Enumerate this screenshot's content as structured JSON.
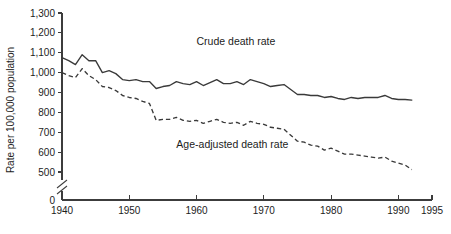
{
  "chart_data": {
    "type": "line",
    "title": "",
    "xlabel": "",
    "ylabel": "Rate per 100,000 population",
    "xlim": [
      1940,
      1995
    ],
    "ylim": [
      500,
      1300
    ],
    "y_axis_break": true,
    "y_axis_break_note": "axis broken between 0 and 500",
    "grid": false,
    "legend_position": "inline-annotation",
    "x_ticks": [
      1940,
      1950,
      1960,
      1970,
      1980,
      1990,
      1995
    ],
    "x_tick_labels": [
      "1940",
      "1950",
      "1960",
      "1970",
      "1980",
      "1990",
      "1995"
    ],
    "y_ticks": [
      500,
      600,
      700,
      800,
      900,
      1000,
      1100,
      1200,
      1300
    ],
    "y_tick_labels": [
      "500",
      "600",
      "700",
      "800",
      "900",
      "1,000",
      "1,100",
      "1,200",
      "1,300"
    ],
    "y_zero_tick_label": "0",
    "x": [
      1940,
      1941,
      1942,
      1943,
      1944,
      1945,
      1946,
      1947,
      1948,
      1949,
      1950,
      1951,
      1952,
      1953,
      1954,
      1955,
      1956,
      1957,
      1958,
      1959,
      1960,
      1961,
      1962,
      1963,
      1964,
      1965,
      1966,
      1967,
      1968,
      1969,
      1970,
      1971,
      1972,
      1973,
      1974,
      1975,
      1976,
      1977,
      1978,
      1979,
      1980,
      1981,
      1982,
      1983,
      1984,
      1985,
      1986,
      1987,
      1988,
      1989,
      1990,
      1991,
      1992
    ],
    "series": [
      {
        "name": "Crude death rate",
        "style": "solid",
        "values": [
          1076,
          1060,
          1040,
          1090,
          1060,
          1060,
          1000,
          1010,
          995,
          965,
          960,
          965,
          955,
          955,
          920,
          930,
          935,
          955,
          945,
          940,
          955,
          935,
          950,
          965,
          945,
          945,
          955,
          940,
          965,
          955,
          945,
          930,
          935,
          940,
          915,
          890,
          890,
          885,
          885,
          875,
          880,
          870,
          865,
          875,
          870,
          875,
          875,
          875,
          885,
          870,
          865,
          865,
          862
        ]
      },
      {
        "name": "Age-adjusted death rate",
        "style": "dashed",
        "values": [
          1000,
          985,
          975,
          1020,
          985,
          965,
          930,
          925,
          910,
          885,
          875,
          870,
          855,
          845,
          760,
          765,
          765,
          775,
          760,
          755,
          760,
          745,
          755,
          765,
          750,
          745,
          750,
          735,
          755,
          745,
          740,
          725,
          720,
          715,
          685,
          655,
          650,
          635,
          630,
          610,
          620,
          605,
          590,
          590,
          585,
          580,
          575,
          570,
          575,
          555,
          545,
          535,
          512
        ]
      }
    ],
    "annotations": [
      {
        "text": "Crude death rate",
        "x": 1960,
        "y": 1140
      },
      {
        "text": "Age-adjusted death rate",
        "x": 1957,
        "y": 620
      }
    ]
  }
}
